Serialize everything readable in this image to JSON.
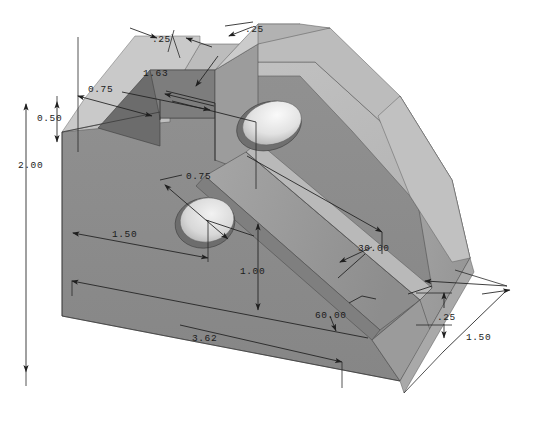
{
  "drawing": {
    "title": "Isometric shaded view of machined bracket block",
    "background_color": "#ffffff",
    "line_color": "#1f1f1f",
    "units_note": "",
    "part": {
      "name": "angled-slotted-block",
      "face_colors": {
        "front": "#8a8a8a",
        "front_lower": "#8f8f8f",
        "top": "#b6b6b6",
        "top_light": "#c4c4c4",
        "recess_dark": "#6b6b6b",
        "slot_floor": "#9a9a9a",
        "chamfer": "#a2a2a2",
        "chamfer_light": "#bdbdbd",
        "right_end": "#909090",
        "hole_shadow": "#7d7d7d",
        "hole_light": "#e8e8e8",
        "edge": "#4a4a4a"
      }
    },
    "dimensions": [
      {
        "id": "overall-height",
        "label": "2.00",
        "kind": "linear",
        "position": "left-vertical"
      },
      {
        "id": "step-height",
        "label": "0.50",
        "kind": "linear",
        "position": "left-vertical-inner"
      },
      {
        "id": "notch-width",
        "label": "0.75",
        "kind": "linear",
        "position": "upper-left"
      },
      {
        "id": "rib-width-left",
        "label": ".25",
        "kind": "linear",
        "position": "top-left"
      },
      {
        "id": "rib-width-right",
        "label": ".25",
        "kind": "linear",
        "position": "top-right"
      },
      {
        "id": "slot-length",
        "label": "1.63",
        "kind": "linear",
        "position": "top-middle"
      },
      {
        "id": "hole-diameter",
        "label": "0.75",
        "kind": "diameter",
        "position": "front-hole"
      },
      {
        "id": "hole-offset-x",
        "label": "1.50",
        "kind": "linear",
        "position": "front-horizontal"
      },
      {
        "id": "hole-offset-y",
        "label": "1.00",
        "kind": "linear",
        "position": "front-vertical"
      },
      {
        "id": "overall-length",
        "label": "3.62",
        "kind": "linear",
        "position": "bottom"
      },
      {
        "id": "slot-angle",
        "label": "30.00",
        "kind": "angular",
        "position": "right-upper"
      },
      {
        "id": "chamfer-angle",
        "label": "60.00",
        "kind": "angular",
        "position": "right-lower"
      },
      {
        "id": "base-thickness",
        "label": ".25",
        "kind": "linear",
        "position": "right-vertical"
      },
      {
        "id": "overall-depth",
        "label": "1.50",
        "kind": "linear",
        "position": "right-depth"
      }
    ]
  }
}
